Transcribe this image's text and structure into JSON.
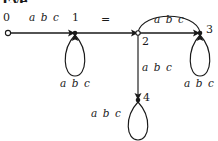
{
  "figure": {
    "type": "state-transition-diagram",
    "clipped_heading": "Eye",
    "equals_sign": "=",
    "alphabet_label": "a b c"
  },
  "nodes": [
    {
      "id": "0",
      "label": "0",
      "shape": "open-circle",
      "x": 8,
      "y": 33,
      "role": "start-state"
    },
    {
      "id": "1",
      "label": "1",
      "shape": "filled-dot",
      "x": 75,
      "y": 33,
      "role": "state"
    },
    {
      "id": "2",
      "label": "2",
      "shape": "open-circle",
      "x": 138,
      "y": 33,
      "role": "state"
    },
    {
      "id": "3",
      "label": "3",
      "shape": "filled-dot",
      "x": 200,
      "y": 33,
      "role": "state"
    },
    {
      "id": "4",
      "label": "4",
      "shape": "filled-dot",
      "x": 138,
      "y": 100,
      "role": "state"
    }
  ],
  "edges": [
    {
      "from": "0",
      "to": "1",
      "label": "a b c",
      "kind": "straight-horizontal"
    },
    {
      "from": "1",
      "to": "1",
      "label": "a b c",
      "kind": "self-loop-down"
    },
    {
      "from": "1",
      "to": "2",
      "label": "",
      "kind": "straight-horizontal"
    },
    {
      "from": "2",
      "to": "3",
      "label": "a b c",
      "kind": "arc-over"
    },
    {
      "from": "2",
      "to": "3",
      "label": "",
      "kind": "straight-horizontal"
    },
    {
      "from": "2",
      "to": "4",
      "label": "a b c",
      "kind": "straight-vertical"
    },
    {
      "from": "3",
      "to": "3",
      "label": "a b c",
      "kind": "self-loop-down"
    },
    {
      "from": "4",
      "to": "4",
      "label": "a b c",
      "kind": "self-loop-down"
    }
  ],
  "labels": {
    "node0": "0",
    "node1": "1",
    "node2": "2",
    "node3": "3",
    "node4": "4",
    "edge_0_1": "a b c",
    "loop_1": "a b c",
    "arc_2_3": "a b c",
    "edge_2_4": "a b c",
    "loop_3": "a b c",
    "loop_4": "a b c",
    "equals": "="
  },
  "colors": {
    "stroke": "#1a1a1a",
    "background": "#ffffff"
  }
}
